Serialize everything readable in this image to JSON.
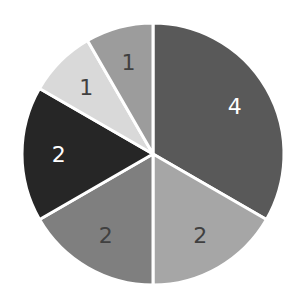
{
  "chart_data": {
    "type": "pie",
    "title": "",
    "start_angle_deg": 0,
    "direction": "clockwise",
    "slices": [
      {
        "label": "4",
        "value": 4,
        "color": "#595959",
        "text_color": "#ffffff"
      },
      {
        "label": "2",
        "value": 2,
        "color": "#a6a6a6",
        "text_color": "#404040"
      },
      {
        "label": "2",
        "value": 2,
        "color": "#7f7f7f",
        "text_color": "#404040"
      },
      {
        "label": "2",
        "value": 2,
        "color": "#262626",
        "text_color": "#ffffff"
      },
      {
        "label": "1",
        "value": 1,
        "color": "#d9d9d9",
        "text_color": "#404040"
      },
      {
        "label": "1",
        "value": 1,
        "color": "#9c9c9c",
        "text_color": "#404040"
      }
    ],
    "legend": "none",
    "data_labels": "values"
  }
}
